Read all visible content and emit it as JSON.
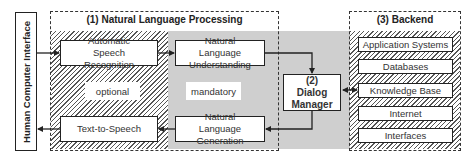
{
  "diagram": {
    "hci": {
      "label": "Human Computer Interface"
    },
    "nlp": {
      "title": "(1) Natural Language Processing",
      "optional_label": "optional",
      "mandatory_label": "mandatory",
      "asr": "Automatic Speech Recognition",
      "nlu": "Natural Language Understanding",
      "tts": "Text-to-Speech",
      "nlg": "Natural Language Generation"
    },
    "dialog_manager": {
      "label": "(2) Dialog Manager"
    },
    "backend": {
      "title": "(3) Backend",
      "items": [
        "Application Systems",
        "Databases",
        "Knowledge Base",
        "Internet",
        "Interfaces"
      ]
    },
    "colors": {
      "mandatory_fill": "#cfcfcf",
      "line": "#222222",
      "hatch": "#555555"
    }
  }
}
